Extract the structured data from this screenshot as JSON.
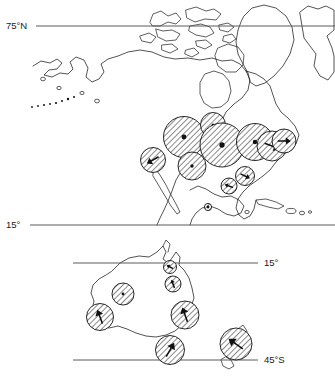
{
  "figure": {
    "type": "proportional-symbol-map",
    "panels": [
      {
        "id": "panel-north-america",
        "name": "North America and Arctic",
        "lat_labels": [
          {
            "text": "75°N",
            "side": "left",
            "y": 26
          },
          {
            "text": "15°",
            "side": "left",
            "y": 225
          }
        ]
      },
      {
        "id": "panel-australia",
        "name": "Australia and New Zealand",
        "lat_labels": [
          {
            "text": "15°",
            "side": "right",
            "y": 263
          },
          {
            "text": "45°S",
            "side": "right",
            "y": 360
          }
        ]
      }
    ]
  },
  "colors": {
    "ink": "#1a1a1a",
    "coastline": "#1a1a1a",
    "latitude_line": "#5a5a5a",
    "hatch": "#2b2b2b",
    "background": "#ffffff"
  },
  "chart_data": {
    "type": "scatter",
    "title": "",
    "subtitle": "",
    "xlabel": "",
    "ylabel": "",
    "grid": false,
    "legend": "none",
    "projection_note": "Two map panels with hatched proportional circles; some circles carry a centre dot, others carry a directional arrow.",
    "latitude_lines": [
      {
        "label": "75°N",
        "panel": "panel-north-america",
        "y": 26,
        "x1": 36,
        "x2": 335
      },
      {
        "label": "15°",
        "panel": "panel-north-america",
        "y": 225,
        "x1": 30,
        "x2": 335
      },
      {
        "label": "15°",
        "panel": "panel-australia",
        "y": 263,
        "x1": 73,
        "x2": 258
      },
      {
        "label": "45°S",
        "panel": "panel-australia",
        "y": 360,
        "x1": 73,
        "x2": 258
      }
    ],
    "symbols": [
      {
        "panel": "panel-north-america",
        "x": 153,
        "y": 160,
        "r": 12.5,
        "marker": "arrow",
        "angle": 150
      },
      {
        "panel": "panel-north-america",
        "x": 184,
        "y": 137,
        "r": 20.5,
        "marker": "dot"
      },
      {
        "panel": "panel-north-america",
        "x": 192,
        "y": 166,
        "r": 14.0,
        "marker": "dot"
      },
      {
        "panel": "panel-north-america",
        "x": 213,
        "y": 125,
        "r": 12.5,
        "marker": "dot"
      },
      {
        "panel": "panel-north-america",
        "x": 222,
        "y": 145,
        "r": 22.0,
        "marker": "dot"
      },
      {
        "panel": "panel-north-america",
        "x": 255,
        "y": 142,
        "r": 18.5,
        "marker": "dot"
      },
      {
        "panel": "panel-north-america",
        "x": 272,
        "y": 146,
        "r": 15.0,
        "marker": "arrow",
        "angle": 20
      },
      {
        "panel": "panel-north-america",
        "x": 284,
        "y": 141,
        "r": 12.0,
        "marker": "arrow",
        "angle": 0
      },
      {
        "panel": "panel-north-america",
        "x": 245,
        "y": 176,
        "r": 9.5,
        "marker": "arrow",
        "angle": 25
      },
      {
        "panel": "panel-north-america",
        "x": 229,
        "y": 186,
        "r": 8.0,
        "marker": "arrow",
        "angle": 200
      },
      {
        "panel": "panel-north-america",
        "x": 208,
        "y": 207,
        "r": 3.6,
        "marker": "dot"
      },
      {
        "panel": "panel-australia",
        "x": 170,
        "y": 267,
        "r": 6.5,
        "marker": "arrow",
        "angle": 210
      },
      {
        "panel": "panel-australia",
        "x": 173,
        "y": 284,
        "r": 8.0,
        "marker": "arrow",
        "angle": 250
      },
      {
        "panel": "panel-australia",
        "x": 123,
        "y": 294,
        "r": 11.0,
        "marker": "dot"
      },
      {
        "panel": "panel-australia",
        "x": 100,
        "y": 317,
        "r": 13.5,
        "marker": "arrow",
        "angle": 250
      },
      {
        "panel": "panel-australia",
        "x": 185,
        "y": 315,
        "r": 14.0,
        "marker": "arrow",
        "angle": 250
      },
      {
        "panel": "panel-australia",
        "x": 170,
        "y": 350,
        "r": 14.5,
        "marker": "arrow",
        "angle": 300
      },
      {
        "panel": "panel-australia",
        "x": 236,
        "y": 344,
        "r": 16.0,
        "marker": "arrow",
        "angle": 215
      }
    ]
  }
}
